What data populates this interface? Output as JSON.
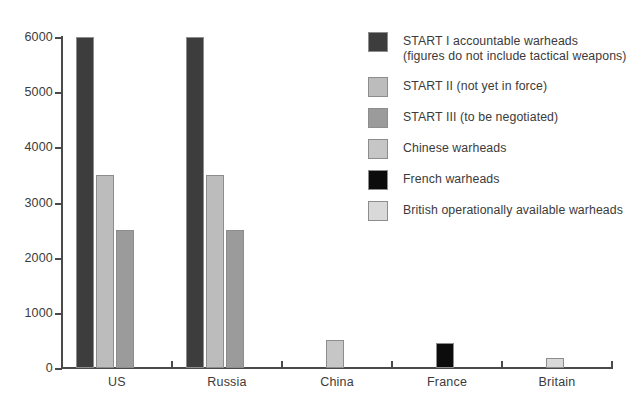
{
  "chart_data": {
    "type": "bar",
    "title": "",
    "subtitle": "",
    "xlabel": "",
    "ylabel": "",
    "ylim": [
      0,
      6000
    ],
    "ytick_values": [
      0,
      1000,
      2000,
      3000,
      4000,
      5000,
      6000
    ],
    "ytick_labels": [
      "0",
      "1000",
      "2000",
      "3000",
      "4000",
      "5000",
      "6000"
    ],
    "grid": false,
    "legend_position": "right",
    "categories": [
      "US",
      "Russia",
      "China",
      "France",
      "Britain"
    ],
    "series": [
      {
        "name": "START I accountable warheads (figures do not include tactical weapons)",
        "legend_label": "START I accountable warheads\n(figures do not include tactical weapons)",
        "color": "#3d3d3d",
        "values": [
          6000,
          6000,
          null,
          null,
          null
        ]
      },
      {
        "name": "START II (not yet in force)",
        "legend_label": "START II (not yet in force)",
        "color": "#bcbcbc",
        "values": [
          3500,
          3500,
          null,
          null,
          null
        ]
      },
      {
        "name": "START III (to be negotiated)",
        "legend_label": "START III (to be negotiated)",
        "color": "#9b9b9b",
        "values": [
          2500,
          2500,
          null,
          null,
          null
        ]
      },
      {
        "name": "Chinese warheads",
        "legend_label": "Chinese warheads",
        "color": "#c6c6c6",
        "values": [
          null,
          null,
          500,
          null,
          null
        ]
      },
      {
        "name": "French warheads",
        "legend_label": "French warheads",
        "color": "#0c0c0c",
        "values": [
          null,
          null,
          null,
          450,
          null
        ]
      },
      {
        "name": "British operationally available warheads",
        "legend_label": "British operationally available warheads",
        "color": "#d9d9d9",
        "values": [
          null,
          null,
          null,
          null,
          185
        ]
      }
    ]
  },
  "axis": {
    "line_color": "#4a4a4a"
  },
  "legend": {
    "entries": [
      {
        "label": "START I accountable warheads\n(figures do not include tactical weapons)",
        "color": "#3d3d3d"
      },
      {
        "label": "START II (not yet in force)",
        "color": "#bcbcbc"
      },
      {
        "label": "START III (to be negotiated)",
        "color": "#9b9b9b"
      },
      {
        "label": "Chinese warheads",
        "color": "#c6c6c6"
      },
      {
        "label": "French warheads",
        "color": "#0c0c0c"
      },
      {
        "label": "British operationally available warheads",
        "color": "#d9d9d9"
      }
    ]
  }
}
